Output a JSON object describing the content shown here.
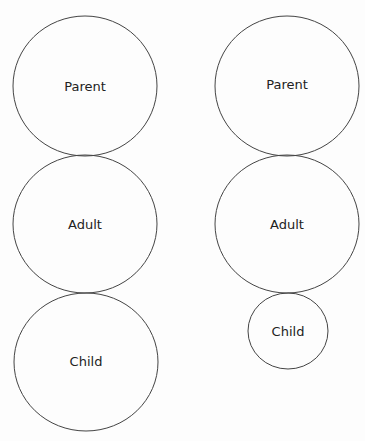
{
  "diagram": {
    "left_column": [
      {
        "label": "Parent",
        "cx": 85,
        "cy": 86,
        "rx": 72,
        "ry": 70
      },
      {
        "label": "Adult",
        "cx": 85,
        "cy": 224,
        "rx": 72,
        "ry": 69
      },
      {
        "label": "Child",
        "cx": 86,
        "cy": 362,
        "rx": 72,
        "ry": 69
      }
    ],
    "right_column": [
      {
        "label": "Parent",
        "cx": 287,
        "cy": 86,
        "rx": 72,
        "ry": 70
      },
      {
        "label": "Adult",
        "cx": 287,
        "cy": 224,
        "rx": 72,
        "ry": 69
      },
      {
        "label": "Child",
        "cx": 288,
        "cy": 331,
        "rx": 40,
        "ry": 38
      }
    ]
  }
}
